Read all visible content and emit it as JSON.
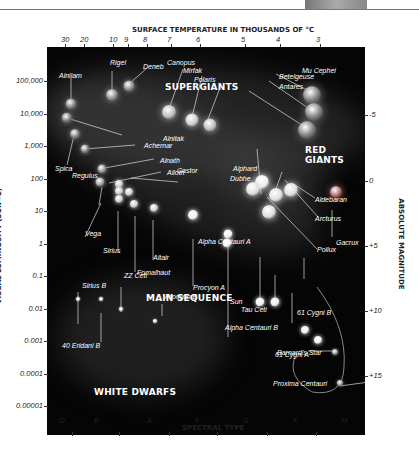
{
  "chart_data": {
    "type": "scatter",
    "top_axis_label": "SURFACE TEMPERATURE IN THOUSANDS OF °C",
    "top_ticks": [
      "30",
      "20",
      "10",
      "9",
      "8",
      "7",
      "6",
      "5",
      "4",
      "3"
    ],
    "xlabel": "SPECTRAL TYPE",
    "x_categories": [
      "O",
      "B",
      "A",
      "F",
      "G",
      "K",
      "M"
    ],
    "ylabel": "VISUAL LUMINOSITY (SUN=1)",
    "y_ticks": [
      "100,000",
      "10,000",
      "1,000",
      "100",
      "10",
      "1",
      "0.1",
      "0.01",
      "0.001",
      "0.0001",
      "0.00001"
    ],
    "right_axis_label": "ABSOLUTE MAGNITUDE",
    "right_ticks": [
      "-5",
      "0",
      "+5",
      "+10",
      "+15"
    ],
    "regions": [
      "SUPERGIANTS",
      "RED GIANTS",
      "MAIN SEQUENCE",
      "WHITE DWARFS"
    ],
    "stars": [
      {
        "name": "Alnilam",
        "spectral": "B0",
        "luminosity": 30000
      },
      {
        "name": "Rigel",
        "spectral": "B8",
        "luminosity": 50000
      },
      {
        "name": "Deneb",
        "spectral": "A2",
        "luminosity": 80000
      },
      {
        "name": "Alnitak",
        "spectral": "O9",
        "luminosity": 15000
      },
      {
        "name": "Canopus",
        "spectral": "F0",
        "luminosity": 15000
      },
      {
        "name": "Mirfak",
        "spectral": "F5",
        "luminosity": 5000
      },
      {
        "name": "Polaris",
        "spectral": "F7",
        "luminosity": 5000
      },
      {
        "name": "Mu Cephei",
        "spectral": "M2",
        "luminosity": 50000
      },
      {
        "name": "Betelgeuse",
        "spectral": "M2",
        "luminosity": 20000
      },
      {
        "name": "Antares",
        "spectral": "M1",
        "luminosity": 8000
      },
      {
        "name": "Spica",
        "spectral": "B1",
        "luminosity": 2000
      },
      {
        "name": "Achernar",
        "spectral": "B3",
        "luminosity": 1000
      },
      {
        "name": "Alnath",
        "spectral": "B7",
        "luminosity": 300
      },
      {
        "name": "Regulus",
        "spectral": "B7",
        "luminosity": 150
      },
      {
        "name": "Alioth",
        "spectral": "A0",
        "luminosity": 100
      },
      {
        "name": "Castor",
        "spectral": "A1",
        "luminosity": 50
      },
      {
        "name": "Vega",
        "spectral": "A0",
        "luminosity": 50
      },
      {
        "name": "Sirius",
        "spectral": "A1",
        "luminosity": 25
      },
      {
        "name": "Fomalhaut",
        "spectral": "A3",
        "luminosity": 15
      },
      {
        "name": "Altair",
        "spectral": "A7",
        "luminosity": 12
      },
      {
        "name": "Alpha Centauri A",
        "spectral": "G2",
        "luminosity": 1.5
      },
      {
        "name": "Procyon A",
        "spectral": "F5",
        "luminosity": 8
      },
      {
        "name": "Sun",
        "spectral": "G2",
        "luminosity": 1
      },
      {
        "name": "Alphard",
        "spectral": "K3",
        "luminosity": 300
      },
      {
        "name": "Dubhe",
        "spectral": "K0",
        "luminosity": 150
      },
      {
        "name": "Aldebaran",
        "spectral": "K5",
        "luminosity": 150
      },
      {
        "name": "Arcturus",
        "spectral": "K2",
        "luminosity": 100
      },
      {
        "name": "Pollux",
        "spectral": "K0",
        "luminosity": 40
      },
      {
        "name": "Gacrux",
        "spectral": "M3",
        "luminosity": 150
      },
      {
        "name": "Tau Ceti",
        "spectral": "G8",
        "luminosity": 0.5
      },
      {
        "name": "Alpha Centauri B",
        "spectral": "K1",
        "luminosity": 0.5
      },
      {
        "name": "61 Cygni B",
        "spectral": "K7",
        "luminosity": 0.08
      },
      {
        "name": "61 Cygni A",
        "spectral": "K5",
        "luminosity": 0.15
      },
      {
        "name": "Barnard's Star",
        "spectral": "M4",
        "luminosity": 0.0004
      },
      {
        "name": "Proxima Centauri",
        "spectral": "M5",
        "luminosity": 6e-05
      },
      {
        "name": "Sirius B",
        "spectral": "B",
        "luminosity": 0.003
      },
      {
        "name": "40 Eridani B",
        "spectral": "B",
        "luminosity": 0.003
      },
      {
        "name": "ZZ Ceti",
        "spectral": "A",
        "luminosity": 0.0012
      },
      {
        "name": "Procyon B",
        "spectral": "A",
        "luminosity": 0.0005
      }
    ]
  }
}
